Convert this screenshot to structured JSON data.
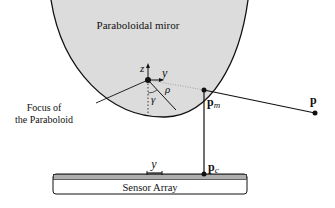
{
  "diagram": {
    "mirror_label": "Paraboloidal miror",
    "focus_label_line1": "Focus of",
    "focus_label_line2": "the Paraboloid",
    "axis_z": "z",
    "axis_y": "y",
    "angle_rho": "ρ",
    "angle_gamma": "γ",
    "point_pm": "p",
    "point_pm_sub": "m",
    "point_p": "p",
    "point_pc": "p",
    "point_pc_sub": "c",
    "sensor_y_label": "y",
    "sensor_label": "Sensor Array",
    "colors": {
      "mirror_fill": "#dcdcdc",
      "line": "#111111"
    }
  }
}
